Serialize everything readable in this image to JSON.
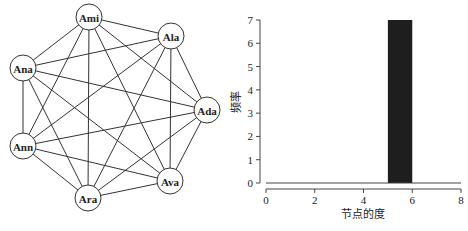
{
  "graph": {
    "type": "complete-graph",
    "nodes": [
      {
        "id": "Ami",
        "label": "Ami",
        "x": 89,
        "y": 17
      },
      {
        "id": "Ala",
        "label": "Ala",
        "x": 171,
        "y": 36
      },
      {
        "id": "Ana",
        "label": "Ana",
        "x": 23,
        "y": 68
      },
      {
        "id": "Ada",
        "label": "Ada",
        "x": 207,
        "y": 110
      },
      {
        "id": "Ann",
        "label": "Ann",
        "x": 23,
        "y": 146
      },
      {
        "id": "Ava",
        "label": "Ava",
        "x": 170,
        "y": 181
      },
      {
        "id": "Ara",
        "label": "Ara",
        "x": 88,
        "y": 198
      }
    ],
    "node_radius": 13
  },
  "chart_data": {
    "type": "bar",
    "title": "",
    "xlabel": "节点的度",
    "ylabel": "频率",
    "bins": [
      {
        "x0": 5,
        "x1": 6,
        "value": 7
      }
    ],
    "categories": [
      "5-6"
    ],
    "values": [
      7
    ],
    "xlim": [
      0,
      8
    ],
    "ylim": [
      0,
      7
    ],
    "xticks": [
      "0",
      "2",
      "4",
      "6",
      "8"
    ],
    "yticks": [
      "0",
      "1",
      "2",
      "3",
      "4",
      "5",
      "6",
      "7"
    ],
    "grid": false,
    "bar_color": "#1e1e1e"
  }
}
